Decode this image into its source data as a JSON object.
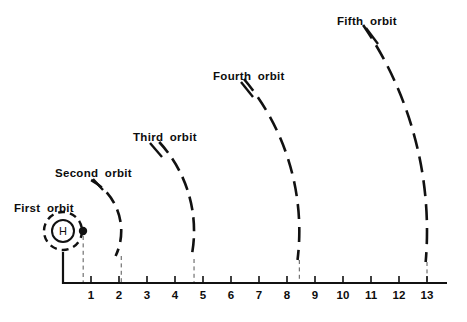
{
  "figure": {
    "background_color": "#ffffff",
    "ink_color": "#111111"
  },
  "nucleus": {
    "symbol": "H",
    "center_x": 63,
    "center_y": 231,
    "core_radius": 11,
    "shell_radius": 19,
    "electron_radius": 4.2,
    "electron_x": 83,
    "electron_y": 231
  },
  "axis": {
    "origin_x": 63,
    "baseline_y": 283,
    "unit_px": 28,
    "top_y": 252,
    "tick_height": 7,
    "end_x": 447,
    "ticks": [
      {
        "value": 1,
        "label": "1"
      },
      {
        "value": 2,
        "label": "2"
      },
      {
        "value": 3,
        "label": "3"
      },
      {
        "value": 4,
        "label": "4"
      },
      {
        "value": 5,
        "label": "5"
      },
      {
        "value": 6,
        "label": "6"
      },
      {
        "value": 7,
        "label": "7"
      },
      {
        "value": 8,
        "label": "8"
      },
      {
        "value": 9,
        "label": "9"
      },
      {
        "value": 10,
        "label": "10"
      },
      {
        "value": 11,
        "label": "11"
      },
      {
        "value": 12,
        "label": "12"
      },
      {
        "value": 13,
        "label": "13"
      }
    ]
  },
  "orbits": [
    {
      "name": "first",
      "label": "First orbit",
      "radius_units": 0.72,
      "label_x": 14,
      "label_y": 202,
      "arc_top_y": 212,
      "dash": "7 5",
      "is_shell": true,
      "drop_top_y": 236
    },
    {
      "name": "second",
      "label": "Second orbit",
      "radius_units": 2.08,
      "label_x": 55,
      "label_y": 167,
      "arc_top_y": 180,
      "dash": "13 7",
      "is_shell": false,
      "drop_top_y": 256
    },
    {
      "name": "third",
      "label": "Third orbit",
      "radius_units": 4.68,
      "label_x": 133,
      "label_y": 131,
      "arc_top_y": 142,
      "dash": "14 7",
      "is_shell": false,
      "drop_top_y": 259
    },
    {
      "name": "fourth",
      "label": "Fourth orbit",
      "radius_units": 8.44,
      "label_x": 213,
      "label_y": 70,
      "arc_top_y": 79,
      "dash": "15 8",
      "is_shell": false,
      "drop_top_y": 260
    },
    {
      "name": "fifth",
      "label": "Fifth orbit",
      "radius_units": 13.0,
      "label_x": 337,
      "label_y": 15,
      "arc_top_y": 25,
      "dash": "16 8",
      "is_shell": false,
      "drop_top_y": 262
    }
  ],
  "chart_data": {
    "type": "scatter",
    "xlabel": "",
    "ylabel": "",
    "xlim": [
      0,
      13.7
    ],
    "grid": false,
    "legend": "none",
    "categories": [
      "First orbit",
      "Second orbit",
      "Third orbit",
      "Fourth orbit",
      "Fifth orbit"
    ],
    "values": [
      0.72,
      2.08,
      4.68,
      8.44,
      13.0
    ],
    "x_tick_labels": [
      "1",
      "2",
      "3",
      "4",
      "5",
      "6",
      "7",
      "8",
      "9",
      "10",
      "11",
      "12",
      "13"
    ],
    "annotations": [
      "H"
    ]
  }
}
